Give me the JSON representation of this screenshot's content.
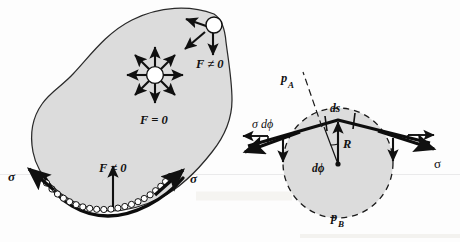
{
  "figure": {
    "background_color": "#fdfdfd",
    "fill_color": "#dcdcdc",
    "stroke_color": "#1a1a1a"
  },
  "left_panel": {
    "name": "liquid-blob-panel",
    "labels": {
      "interior_molecule": "F = 0",
      "surface_molecule": "F ≠ 0",
      "bottom_net_force": "F ≠ 0",
      "sigma_left": "σ",
      "sigma_right": "σ"
    },
    "interior_arrow_count": 8,
    "surface_arrow_count": 3,
    "molecule_bead_count": 24
  },
  "right_panel": {
    "name": "surface-element-panel",
    "labels": {
      "pressure_above": "p",
      "pressure_above_sub": "A",
      "pressure_below": "p",
      "pressure_below_sub": "B",
      "arc_length": "ds",
      "radius": "R",
      "angle": "dϕ",
      "tension_left": "σ dϕ",
      "tension_right": "σ"
    },
    "radius_px": 55
  }
}
